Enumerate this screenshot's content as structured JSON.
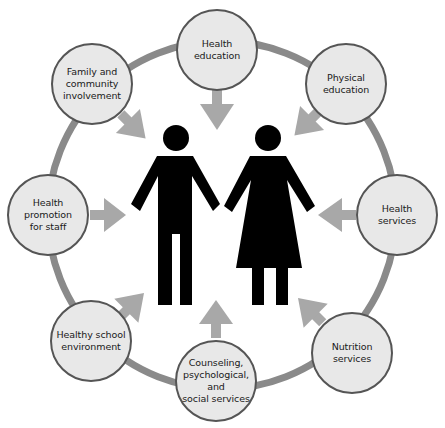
{
  "diagram": {
    "title": "",
    "colors": {
      "ring": "#8a8a8a",
      "node_fill": "#e8e8e8",
      "node_border": "#555555",
      "arrow": "#a8a8a8",
      "figure": "#000000",
      "text": "#1a1a1a"
    },
    "center": {
      "description": "Two pictogram figures (man and woman) holding hands",
      "figures": [
        "man",
        "woman"
      ]
    },
    "nodes": [
      {
        "id": "health-education",
        "label": "Health\neducation",
        "cx": 217,
        "cy": 50
      },
      {
        "id": "physical-education",
        "label": "Physical\neducation",
        "cx": 346,
        "cy": 84
      },
      {
        "id": "health-services",
        "label": "Health\nservices",
        "cx": 397,
        "cy": 215
      },
      {
        "id": "nutrition-services",
        "label": "Nutrition\nservices",
        "cx": 352,
        "cy": 353
      },
      {
        "id": "counseling",
        "label": "Counseling,\npsychological,\nand\nsocial services",
        "cx": 216,
        "cy": 381
      },
      {
        "id": "healthy-school-environment",
        "label": "Healthy school\nenvironment",
        "cx": 91,
        "cy": 341
      },
      {
        "id": "health-promotion-staff",
        "label": "Health promotion\nfor staff",
        "cx": 48,
        "cy": 215
      },
      {
        "id": "family-community",
        "label": "Family and\ncommunity\ninvolvement",
        "cx": 92,
        "cy": 84
      }
    ],
    "arrows_point_to": "center figures"
  }
}
